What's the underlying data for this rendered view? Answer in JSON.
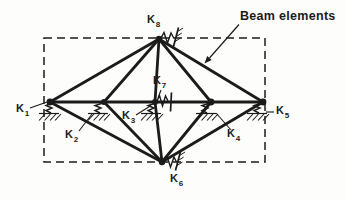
{
  "colors": {
    "ink": "#1b1b1b",
    "background": "#fdfdfc"
  },
  "annotation": {
    "text": "Beam elements"
  },
  "labels": {
    "k1": {
      "base": "K",
      "sub": "1"
    },
    "k2": {
      "base": "K",
      "sub": "2"
    },
    "k3": {
      "base": "K",
      "sub": "3"
    },
    "k4": {
      "base": "K",
      "sub": "4"
    },
    "k5": {
      "base": "K",
      "sub": "5"
    },
    "k6": {
      "base": "K",
      "sub": "6"
    },
    "k7": {
      "base": "K",
      "sub": "7"
    },
    "k8": {
      "base": "K",
      "sub": "8"
    }
  }
}
